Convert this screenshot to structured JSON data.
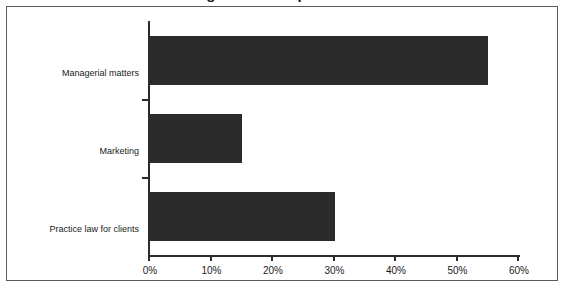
{
  "chart_data": {
    "type": "bar",
    "orientation": "horizontal",
    "title": "Percentage of Time Spent on Activities",
    "title_clipped": true,
    "categories": [
      "Managerial matters",
      "Marketing",
      "Practice law for clients"
    ],
    "values": [
      55,
      15,
      30
    ],
    "xlabel": "",
    "ylabel": "",
    "xlim": [
      0,
      60
    ],
    "xticks": [
      0,
      10,
      20,
      30,
      40,
      50,
      60
    ],
    "xtick_labels": [
      "0%",
      "10%",
      "20%",
      "30%",
      "40%",
      "50%",
      "60%"
    ],
    "grid": false,
    "legend": false,
    "bar_color": "#2b2b2b",
    "axis_color": "#2b2b2b",
    "frame_color": "#5a5a5a",
    "background_color": "#ffffff"
  }
}
